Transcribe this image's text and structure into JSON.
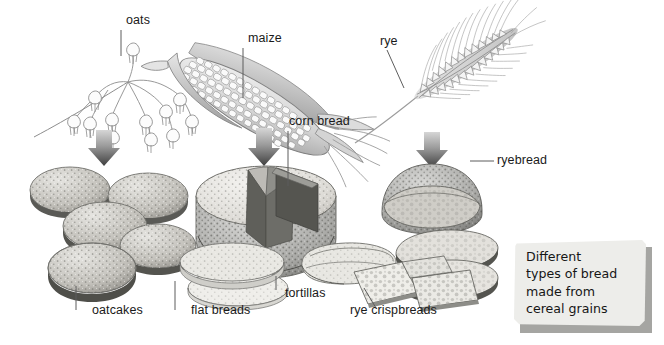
{
  "figure": {
    "title": "Different types of bread made from cereal grains",
    "background_color": "#ffffff",
    "ink_color": "#5d5d5d",
    "label_color": "#1a1a1a"
  },
  "labels": {
    "oats": "oats",
    "maize": "maize",
    "rye": "rye",
    "corn_bread": "corn bread",
    "ryebread": "ryebread",
    "oatcakes": "oatcakes",
    "flat_breads": "flat breads",
    "tortillas": "tortillas",
    "rye_crispbreads": "rye crispbreads"
  },
  "caption": {
    "lines": [
      "Different",
      "types of bread",
      "made from",
      "cereal grains"
    ],
    "panel_color": "#ededea",
    "shadow_color": "#a5a5a2"
  },
  "illustrations": [
    {
      "name": "oat-plant",
      "type": "cereal-plant",
      "label": "oats"
    },
    {
      "name": "maize-cob",
      "type": "cereal-plant",
      "label": "maize"
    },
    {
      "name": "rye-ear",
      "type": "cereal-plant",
      "label": "rye"
    },
    {
      "name": "oatcakes-stack",
      "type": "bread",
      "label": "oatcakes"
    },
    {
      "name": "corn-bread-loaf",
      "type": "bread",
      "label": "corn bread"
    },
    {
      "name": "flat-breads-stack",
      "type": "bread",
      "label": "flat breads"
    },
    {
      "name": "tortilla-roll",
      "type": "bread",
      "label": "tortillas"
    },
    {
      "name": "rye-bread-loaf",
      "type": "bread",
      "label": "ryebread"
    },
    {
      "name": "rye-crispbread-pieces",
      "type": "bread",
      "label": "rye crispbreads"
    }
  ],
  "arrows": [
    {
      "name": "arrow-oats-to-oatcakes",
      "direction": "down",
      "color_top": "#cfcfcf",
      "color_bottom": "#4a4a4a"
    },
    {
      "name": "arrow-maize-to-cornbread",
      "direction": "down",
      "color_top": "#cfcfcf",
      "color_bottom": "#4a4a4a"
    },
    {
      "name": "arrow-rye-to-ryebread",
      "direction": "down",
      "color_top": "#cfcfcf",
      "color_bottom": "#4a4a4a"
    }
  ]
}
